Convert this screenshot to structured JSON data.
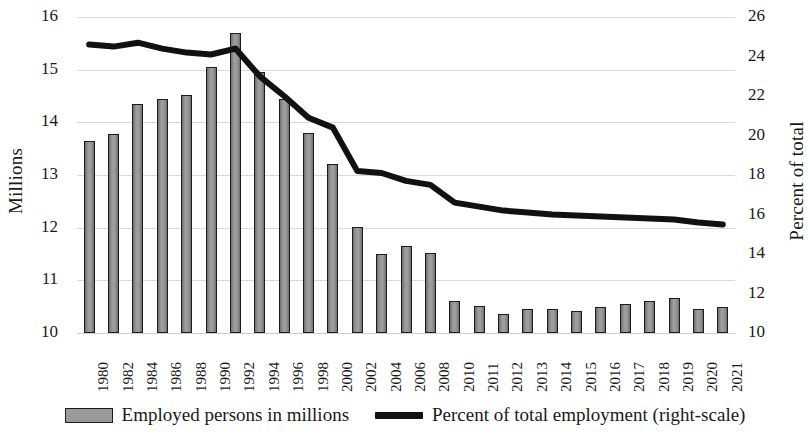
{
  "chart_data": {
    "type": "bar",
    "title": "",
    "subtitle": "",
    "xlabel": "",
    "ylabel": "Millions",
    "y2label": "Percent of total",
    "ylim": [
      10,
      16
    ],
    "y2lim": [
      10,
      26
    ],
    "yticks": [
      10,
      11,
      12,
      13,
      14,
      15,
      16
    ],
    "y2ticks": [
      10,
      12,
      14,
      16,
      18,
      20,
      22,
      24,
      26
    ],
    "grid": true,
    "legend_position": "bottom-center",
    "categories": [
      "1980",
      "1982",
      "1984",
      "1986",
      "1988",
      "1990",
      "1992",
      "1994",
      "1996",
      "1998",
      "2000",
      "2002",
      "2004",
      "2006",
      "2008",
      "2010",
      "2011",
      "2012",
      "2013",
      "2014",
      "2015",
      "2016",
      "2017",
      "2018",
      "2019",
      "2020",
      "2021"
    ],
    "series": [
      {
        "name": "Employed persons in millions",
        "type": "bar",
        "axis": "left",
        "color": "#9a9a9a",
        "edge_color": "#1c1c1c",
        "values": [
          13.65,
          13.78,
          14.35,
          14.45,
          14.52,
          15.05,
          15.7,
          14.95,
          14.45,
          13.8,
          13.2,
          12.02,
          11.5,
          11.66,
          11.52,
          10.6,
          10.52,
          10.36,
          10.46,
          10.46,
          10.42,
          10.5,
          10.55,
          10.6,
          10.66,
          10.46,
          10.5
        ]
      },
      {
        "name": "Percent of total employment (right-scale)",
        "type": "line",
        "axis": "right",
        "color": "#111111",
        "values": [
          24.6,
          24.5,
          24.7,
          24.4,
          24.2,
          24.1,
          24.4,
          23.0,
          22.0,
          20.9,
          20.4,
          18.2,
          18.1,
          17.7,
          17.5,
          16.6,
          16.4,
          16.2,
          16.1,
          16.0,
          15.95,
          15.9,
          15.85,
          15.8,
          15.75,
          15.6,
          15.5
        ]
      }
    ]
  },
  "axes": {
    "left_title": "Millions",
    "right_title": "Percent of total"
  },
  "legend": {
    "items": [
      {
        "label": "Employed persons in millions",
        "marker": "bar-swatch"
      },
      {
        "label": "Percent of total employment (right-scale)",
        "marker": "line-swatch"
      }
    ]
  }
}
